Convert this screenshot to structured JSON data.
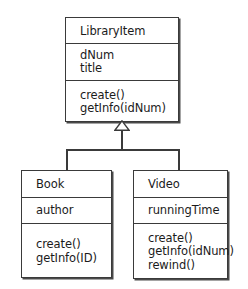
{
  "diagram": {
    "type": "uml-class-diagram",
    "background_color": "#ffffff",
    "line_color": "#3a3a3a",
    "text_color": "#1b1b1b",
    "relationship": {
      "kind": "generalization",
      "arrowhead": "hollow-triangle",
      "parent": "LibraryItem",
      "children": [
        "Book",
        "Video"
      ]
    },
    "classes": [
      {
        "name": "LibraryItem",
        "attributes": [
          "dNum",
          "title"
        ],
        "operations": [
          "create()",
          "getInfo(idNum)"
        ]
      },
      {
        "name": "Book",
        "attributes": [
          "author"
        ],
        "operations": [
          "create()",
          "getInfo(ID)"
        ]
      },
      {
        "name": "Video",
        "attributes": [
          "runningTime"
        ],
        "operations": [
          "create()",
          "getInfo(idNum)",
          "rewind()"
        ]
      }
    ]
  }
}
